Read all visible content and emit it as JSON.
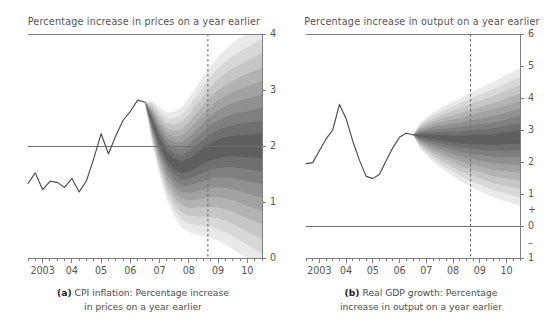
{
  "figure": {
    "kind": "fan-chart-pair",
    "background": "#ffffff",
    "line_color": "#4a4a50",
    "axis_color": "#7d7d7d",
    "fan_color": "#6e6e6e"
  },
  "panels": {
    "a": {
      "id": "cpi-inflation",
      "top_title": "Percentage increase in prices on a year earlier",
      "caption_label": "(a)",
      "caption_line1": "CPI inflation: Percentage increase",
      "caption_line2": "in prices on a year earlier"
    },
    "b": {
      "id": "real-gdp-growth",
      "top_title": "Percentage increase in output on a year earlier",
      "caption_label": "(b)",
      "caption_line1": "Real GDP growth: Percentage",
      "caption_line2": "increase in output on a year earlier"
    }
  },
  "chart_data": [
    {
      "type": "area",
      "id": "cpi-inflation-fan",
      "title": "Percentage increase in prices on a year earlier",
      "subtitle": "(a) CPI inflation: Percentage increase in prices on a year earlier",
      "xlabel": "",
      "ylabel": "",
      "grid": false,
      "legend": "none",
      "y_side": "right",
      "ylim": [
        0,
        4
      ],
      "yticks": [
        0,
        1,
        2,
        3,
        4
      ],
      "ytick_labels": [
        "0",
        "1",
        "2",
        "3",
        "4"
      ],
      "xlim": [
        2002.5,
        2010.5
      ],
      "xticks": [
        2003,
        2004,
        2005,
        2006,
        2007,
        2008,
        2009,
        2010
      ],
      "xtick_labels": [
        "2003",
        "04",
        "05",
        "06",
        "07",
        "08",
        "09",
        "10"
      ],
      "minor_xtick_step": 0.25,
      "reference_lines": [
        {
          "name": "inflation-target",
          "orientation": "horizontal",
          "value": 2.0,
          "style": "solid"
        },
        {
          "name": "forecast-horizon",
          "orientation": "vertical",
          "value": 2008.65,
          "style": "dashed"
        }
      ],
      "history": {
        "name": "CPI inflation (outturn)",
        "x": [
          2002.5,
          2002.75,
          2003.0,
          2003.25,
          2003.5,
          2003.75,
          2004.0,
          2004.25,
          2004.5,
          2004.75,
          2005.0,
          2005.25,
          2005.5,
          2005.75,
          2006.0,
          2006.25,
          2006.5
        ],
        "y": [
          1.33,
          1.52,
          1.22,
          1.37,
          1.35,
          1.26,
          1.42,
          1.18,
          1.38,
          1.78,
          2.22,
          1.86,
          2.18,
          2.46,
          2.62,
          2.82,
          2.78
        ]
      },
      "central_projection": {
        "name": "Central projection (modal path)",
        "x": [
          2006.5,
          2006.75,
          2007.0,
          2007.25,
          2007.5,
          2007.75,
          2008.0,
          2008.25,
          2008.5,
          2008.75,
          2009.0,
          2009.25,
          2009.5,
          2009.75,
          2010.0,
          2010.25,
          2010.5
        ],
        "y": [
          2.78,
          2.42,
          2.08,
          1.82,
          1.68,
          1.62,
          1.66,
          1.74,
          1.82,
          1.9,
          1.95,
          1.98,
          2.0,
          2.0,
          2.0,
          2.0,
          2.0
        ]
      },
      "bands": {
        "description": "Nine nested shaded probability bands around the central projection; darkest in the middle, lightest at the edges.",
        "count": 9,
        "widths_at_horizon_end": [
          0.22,
          0.45,
          0.68,
          0.92,
          1.16,
          1.4,
          1.66,
          1.92,
          2.2
        ],
        "shades": [
          "#5f5f5f",
          "#6e6e6e",
          "#7e7e7e",
          "#8f8f8f",
          "#a1a1a1",
          "#b3b3b3",
          "#c5c5c5",
          "#d7d7d7",
          "#e8e8e8"
        ]
      }
    },
    {
      "type": "area",
      "id": "real-gdp-growth-fan",
      "title": "Percentage increase in output on a year earlier",
      "subtitle": "(b) Real GDP growth: Percentage increase in output on a year earlier",
      "xlabel": "",
      "ylabel": "",
      "grid": false,
      "legend": "none",
      "y_side": "right",
      "ylim": [
        -1,
        6
      ],
      "yticks": [
        -1,
        0,
        1,
        2,
        3,
        4,
        5,
        6
      ],
      "ytick_labels": [
        "1",
        "0",
        "1",
        "2",
        "3",
        "4",
        "5",
        "6"
      ],
      "ytick_signs": {
        "plus_between": "+",
        "minus_between": "–"
      },
      "xlim": [
        2002.5,
        2010.5
      ],
      "xticks": [
        2003,
        2004,
        2005,
        2006,
        2007,
        2008,
        2009,
        2010
      ],
      "xtick_labels": [
        "2003",
        "04",
        "05",
        "06",
        "07",
        "08",
        "09",
        "10"
      ],
      "minor_xtick_step": 0.25,
      "reference_lines": [
        {
          "name": "zero-line",
          "orientation": "horizontal",
          "value": 0.0,
          "style": "solid"
        },
        {
          "name": "forecast-horizon",
          "orientation": "vertical",
          "value": 2008.65,
          "style": "dashed"
        }
      ],
      "history": {
        "name": "Real GDP growth (outturn)",
        "x": [
          2002.5,
          2002.75,
          2003.0,
          2003.25,
          2003.5,
          2003.75,
          2004.0,
          2004.25,
          2004.5,
          2004.75,
          2005.0,
          2005.25,
          2005.5,
          2005.75,
          2006.0,
          2006.25,
          2006.5
        ],
        "y": [
          1.95,
          1.98,
          2.35,
          2.72,
          3.0,
          3.8,
          3.35,
          2.65,
          2.05,
          1.55,
          1.48,
          1.62,
          2.05,
          2.45,
          2.78,
          2.9,
          2.85
        ]
      },
      "central_projection": {
        "name": "Central projection (modal path)",
        "x": [
          2006.5,
          2006.75,
          2007.0,
          2007.25,
          2007.5,
          2007.75,
          2008.0,
          2008.25,
          2008.5,
          2008.75,
          2009.0,
          2009.25,
          2009.5,
          2009.75,
          2010.0,
          2010.25,
          2010.5
        ],
        "y": [
          2.85,
          2.82,
          2.8,
          2.78,
          2.76,
          2.74,
          2.72,
          2.7,
          2.7,
          2.7,
          2.7,
          2.7,
          2.7,
          2.72,
          2.74,
          2.76,
          2.78
        ]
      },
      "bands": {
        "description": "Nine nested shaded probability bands around the central projection; darkest in the middle, lightest at the edges.",
        "count": 9,
        "widths_at_horizon_end": [
          0.2,
          0.42,
          0.64,
          0.88,
          1.12,
          1.36,
          1.62,
          1.88,
          2.15
        ],
        "shades": [
          "#5f5f5f",
          "#6e6e6e",
          "#7e7e7e",
          "#8f8f8f",
          "#a1a1a1",
          "#b3b3b3",
          "#c5c5c5",
          "#d7d7d7",
          "#e8e8e8"
        ]
      }
    }
  ]
}
